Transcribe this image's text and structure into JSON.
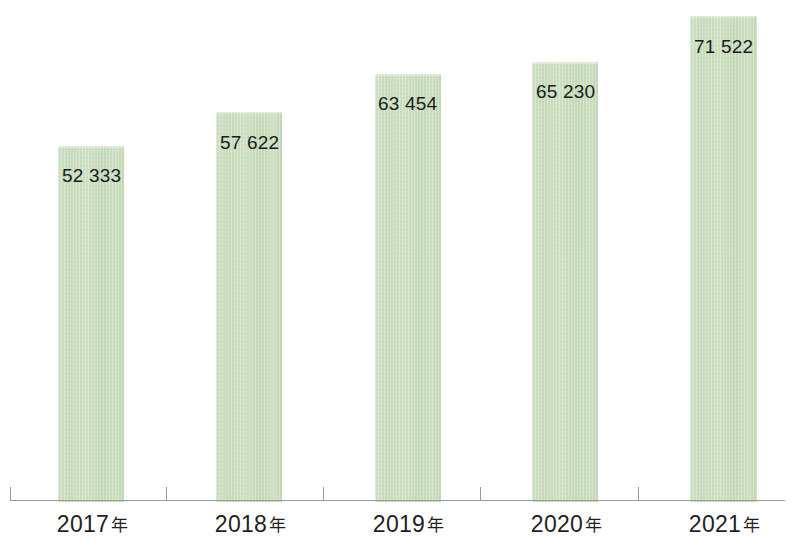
{
  "chart_data": {
    "type": "bar",
    "title": "",
    "subtitle": "",
    "xlabel": "",
    "ylabel": "",
    "grid": false,
    "legend": false,
    "axis_visible": {
      "x": true,
      "y": false
    },
    "ylim": [
      0,
      77000
    ],
    "categories": [
      "2017年",
      "2018年",
      "2019年",
      "2020年",
      "2021年"
    ],
    "values": [
      52333,
      57622,
      63454,
      65230,
      71522
    ],
    "value_labels": [
      "52 333",
      "57 622",
      "63 454",
      "65 230",
      "71 522"
    ],
    "bar_color": "#c9ddbc",
    "axis_color": "#9a9a9a",
    "label_color": "#1c1c1c",
    "points": [
      {
        "category": "2017年",
        "year_number": "2017",
        "year_suffix": "年",
        "value": 52333,
        "label": "52 333"
      },
      {
        "category": "2018年",
        "year_number": "2018",
        "year_suffix": "年",
        "value": 57622,
        "label": "57 622"
      },
      {
        "category": "2019年",
        "year_number": "2019",
        "year_suffix": "年",
        "value": 63454,
        "label": "63 454"
      },
      {
        "category": "2020年",
        "year_number": "2020",
        "year_suffix": "年",
        "value": 65230,
        "label": "65 230"
      },
      {
        "category": "2021年",
        "year_number": "2021",
        "year_suffix": "年",
        "value": 71522,
        "label": "71 522"
      }
    ]
  },
  "geometry": {
    "bars": [
      {
        "x": 58,
        "width": 66,
        "top": 144,
        "label_x": 62,
        "label_y": 166
      },
      {
        "x": 216,
        "width": 66,
        "top": 110,
        "label_x": 220,
        "label_y": 133
      },
      {
        "x": 375,
        "width": 66,
        "top": 72,
        "label_x": 378,
        "label_y": 94
      },
      {
        "x": 532,
        "width": 66,
        "top": 60,
        "label_x": 536,
        "label_y": 82
      },
      {
        "x": 690,
        "width": 67,
        "top": 14,
        "label_x": 694,
        "label_y": 37
      }
    ],
    "ticks": [
      10,
      166,
      323,
      480,
      638
    ],
    "x_labels": [
      {
        "x": 30,
        "width": 125
      },
      {
        "x": 188,
        "width": 125
      },
      {
        "x": 346,
        "width": 125
      },
      {
        "x": 504,
        "width": 125
      },
      {
        "x": 662,
        "width": 125
      }
    ],
    "baseline_y": 500
  }
}
